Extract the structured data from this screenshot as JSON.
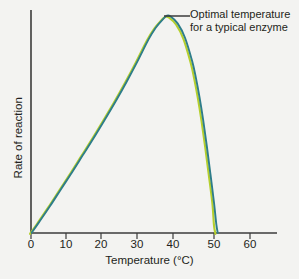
{
  "figure": {
    "background_color": "#f3f3f1",
    "width": 299,
    "height": 279
  },
  "annotation": {
    "line1": "Optimal temperature",
    "line2": "for a typical enzyme",
    "leader_color": "#3b3b3b"
  },
  "axes": {
    "x_title": "Temperature (°C)",
    "y_title": "Rate of reaction",
    "axis_color": "#3b3b3b",
    "tick_labels": [
      "0",
      "10",
      "20",
      "30",
      "40",
      "50",
      "60"
    ]
  },
  "chart_data": {
    "type": "line",
    "title": "",
    "subtitle": "",
    "xlabel": "Temperature (°C)",
    "ylabel": "Rate of reaction",
    "xlim": [
      0,
      70
    ],
    "ylim": [
      0,
      1
    ],
    "grid": false,
    "legend_position": "none",
    "x_ticks": [
      0,
      10,
      20,
      30,
      40,
      50,
      60
    ],
    "y_ticks": [],
    "annotations": [
      {
        "text": "Optimal temperature for a typical enzyme",
        "target_x": 37,
        "target_y": 1.0,
        "leader": "horizontal"
      }
    ],
    "series": [
      {
        "name": "enzyme-rate-teal",
        "color": "#2e7d8a",
        "x": [
          0,
          2,
          5,
          8,
          11,
          14,
          17,
          20,
          23,
          26,
          29,
          32,
          34,
          36,
          37,
          38,
          40,
          42,
          44,
          45,
          46,
          47,
          48,
          49,
          50,
          50.6,
          51
        ],
        "values": [
          0,
          0.048,
          0.122,
          0.2,
          0.277,
          0.357,
          0.437,
          0.52,
          0.605,
          0.695,
          0.79,
          0.89,
          0.945,
          0.985,
          1.0,
          0.998,
          0.965,
          0.9,
          0.79,
          0.715,
          0.625,
          0.52,
          0.4,
          0.27,
          0.135,
          0.04,
          0
        ]
      },
      {
        "name": "enzyme-rate-yellow-green",
        "color": "#b5cf2e",
        "x": [
          0,
          2,
          5,
          8,
          11,
          14,
          17,
          20,
          23,
          26,
          29,
          32,
          34,
          36,
          37,
          38,
          40,
          42,
          44,
          45,
          46,
          47,
          48,
          49,
          50,
          50.4,
          50.8
        ],
        "values": [
          0,
          0.048,
          0.122,
          0.2,
          0.277,
          0.357,
          0.437,
          0.52,
          0.605,
          0.695,
          0.79,
          0.89,
          0.945,
          0.985,
          1.0,
          0.998,
          0.965,
          0.9,
          0.79,
          0.715,
          0.625,
          0.52,
          0.4,
          0.27,
          0.135,
          0.04,
          0
        ]
      }
    ],
    "notes": {
      "optimal_temperature_c": 37,
      "denaturation_temperature_c": 51
    }
  }
}
